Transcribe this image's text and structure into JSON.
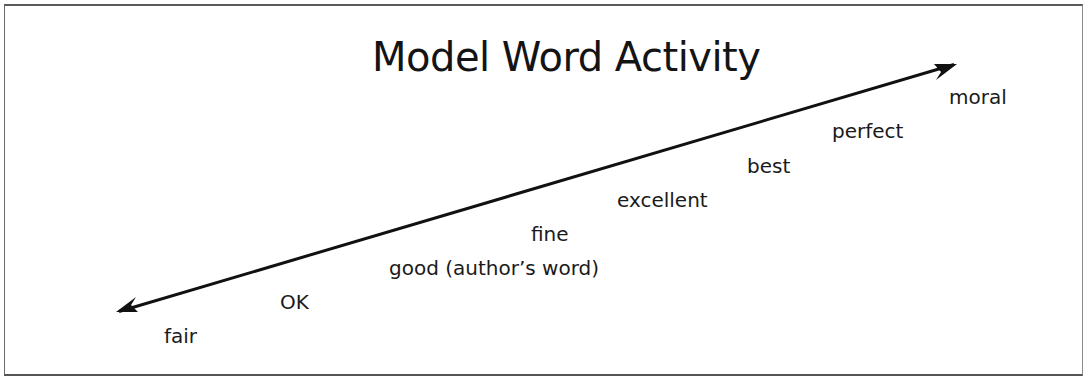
{
  "figure": {
    "title": "Model Word Activity",
    "arrow": {
      "type": "double-headed",
      "start": [
        117,
        312
      ],
      "end": [
        956,
        64
      ],
      "color": "#111111"
    },
    "words": [
      {
        "label": "fair",
        "x": 164,
        "y": 322
      },
      {
        "label": "OK",
        "x": 280,
        "y": 288
      },
      {
        "label": "good (author’s word)",
        "x": 389,
        "y": 254
      },
      {
        "label": "fine",
        "x": 531,
        "y": 220
      },
      {
        "label": "excellent",
        "x": 617,
        "y": 186
      },
      {
        "label": "best",
        "x": 747,
        "y": 152
      },
      {
        "label": "perfect",
        "x": 832,
        "y": 117
      },
      {
        "label": "moral",
        "x": 949,
        "y": 83
      }
    ]
  }
}
